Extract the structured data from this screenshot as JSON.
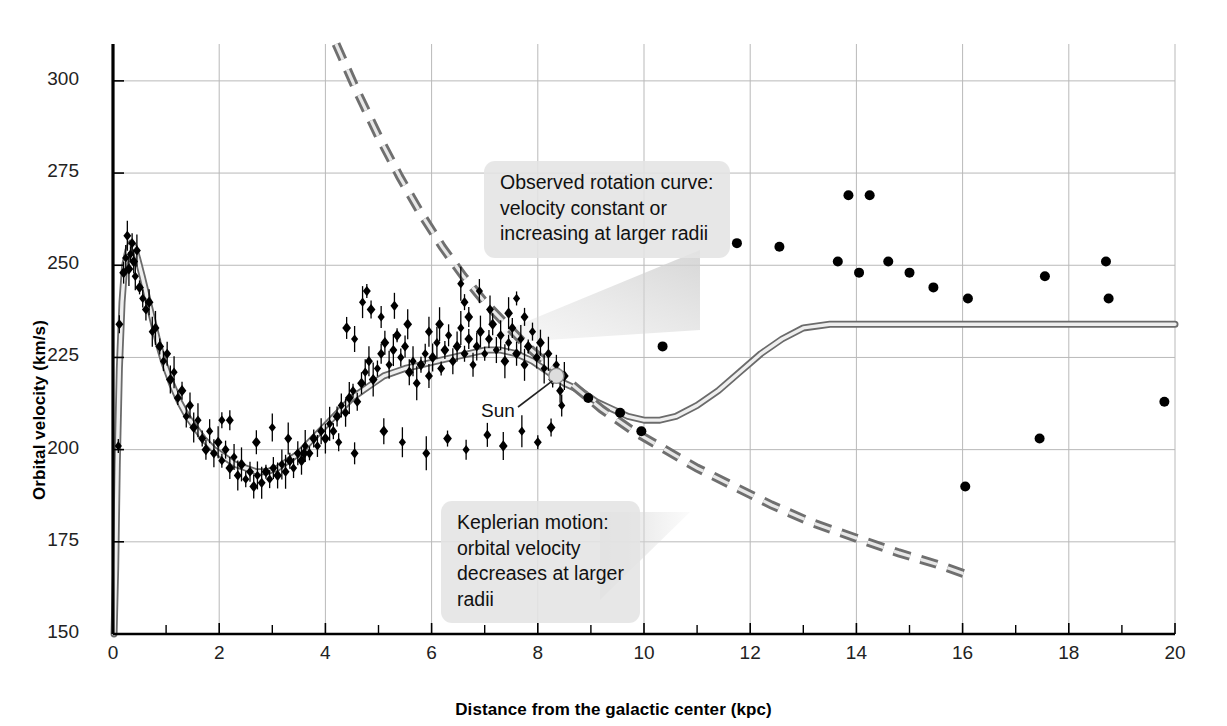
{
  "chart_data": {
    "type": "line",
    "title": "",
    "xlabel": "Distance from the galactic center (kpc)",
    "ylabel": "Orbital velocity (km/s)",
    "xlim": [
      0,
      20
    ],
    "ylim": [
      150,
      310
    ],
    "xticks": [
      0,
      2,
      4,
      6,
      8,
      10,
      12,
      14,
      16,
      18,
      20
    ],
    "xtick_labels": [
      "0",
      "2",
      "4",
      "6",
      "8",
      "10",
      "12",
      "14",
      "16",
      "18",
      "20"
    ],
    "x_minor_ticks": [
      1,
      3,
      5,
      7,
      9,
      11,
      13,
      15,
      17,
      19
    ],
    "yticks": [
      150,
      175,
      200,
      225,
      250,
      275,
      300
    ],
    "ytick_labels": [
      "150",
      "175",
      "200",
      "225",
      "250",
      "275",
      "300"
    ],
    "grid": true,
    "legend_position": "none",
    "series": [
      {
        "name": "Observed rotation curve (model fit)",
        "type": "line",
        "style": "solid-thick-gray",
        "color": "#9a9a9a",
        "points": [
          [
            0.02,
            150
          ],
          [
            0.05,
            168
          ],
          [
            0.08,
            196
          ],
          [
            0.12,
            222
          ],
          [
            0.17,
            240
          ],
          [
            0.22,
            250
          ],
          [
            0.28,
            254
          ],
          [
            0.34,
            256
          ],
          [
            0.4,
            255
          ],
          [
            0.46,
            252
          ],
          [
            0.55,
            247
          ],
          [
            0.65,
            241
          ],
          [
            0.75,
            235
          ],
          [
            0.85,
            229
          ],
          [
            0.95,
            224
          ],
          [
            1.1,
            218
          ],
          [
            1.25,
            213
          ],
          [
            1.4,
            209
          ],
          [
            1.55,
            206
          ],
          [
            1.7,
            203
          ],
          [
            1.9,
            200
          ],
          [
            2.1,
            198
          ],
          [
            2.3,
            196
          ],
          [
            2.5,
            195
          ],
          [
            2.7,
            194
          ],
          [
            2.9,
            194
          ],
          [
            3.1,
            195
          ],
          [
            3.3,
            197
          ],
          [
            3.5,
            199
          ],
          [
            3.7,
            202
          ],
          [
            3.9,
            205
          ],
          [
            4.1,
            208
          ],
          [
            4.3,
            211
          ],
          [
            4.5,
            214
          ],
          [
            4.7,
            216
          ],
          [
            4.9,
            218
          ],
          [
            5.1,
            220
          ],
          [
            5.3,
            221
          ],
          [
            5.5,
            222
          ],
          [
            5.8,
            223
          ],
          [
            6.1,
            224
          ],
          [
            6.4,
            225
          ],
          [
            6.7,
            226
          ],
          [
            7.0,
            227
          ],
          [
            7.3,
            227
          ],
          [
            7.6,
            226
          ],
          [
            7.9,
            224
          ],
          [
            8.2,
            221
          ],
          [
            8.5,
            218
          ],
          [
            8.8,
            216
          ],
          [
            9.1,
            213
          ],
          [
            9.4,
            211
          ],
          [
            9.7,
            209
          ],
          [
            10.0,
            208
          ],
          [
            10.3,
            208
          ],
          [
            10.6,
            209
          ],
          [
            11.0,
            212
          ],
          [
            11.4,
            216
          ],
          [
            11.8,
            221
          ],
          [
            12.2,
            226
          ],
          [
            12.6,
            230
          ],
          [
            13.0,
            233
          ],
          [
            13.5,
            234
          ],
          [
            14.0,
            234
          ],
          [
            16.0,
            234
          ],
          [
            18.0,
            234
          ],
          [
            20.0,
            234
          ]
        ]
      },
      {
        "name": "Keplerian motion",
        "type": "line",
        "style": "dashed-thick-gray",
        "color": "#8d8d8d",
        "points": [
          [
            4.2,
            310
          ],
          [
            4.6,
            297
          ],
          [
            5.0,
            285
          ],
          [
            5.4,
            274
          ],
          [
            5.8,
            264
          ],
          [
            6.2,
            255
          ],
          [
            6.6,
            247
          ],
          [
            7.0,
            240
          ],
          [
            7.4,
            234
          ],
          [
            7.8,
            228
          ],
          [
            8.2,
            223
          ],
          [
            8.7,
            217
          ],
          [
            9.2,
            211
          ],
          [
            9.8,
            205
          ],
          [
            10.4,
            200
          ],
          [
            11.0,
            195
          ],
          [
            11.7,
            190
          ],
          [
            12.4,
            185
          ],
          [
            13.2,
            180
          ],
          [
            14.0,
            176
          ],
          [
            14.8,
            172
          ],
          [
            15.5,
            169
          ],
          [
            16.1,
            166
          ]
        ]
      },
      {
        "name": "Inner disk measurements (with error bars)",
        "type": "scatter",
        "marker": "diamond",
        "color": "#000000",
        "points": [
          [
            0.1,
            201
          ],
          [
            0.12,
            234
          ],
          [
            0.2,
            248
          ],
          [
            0.24,
            252
          ],
          [
            0.27,
            258
          ],
          [
            0.3,
            249
          ],
          [
            0.33,
            253
          ],
          [
            0.36,
            256
          ],
          [
            0.39,
            251
          ],
          [
            0.42,
            247
          ],
          [
            0.45,
            254
          ],
          [
            0.5,
            244
          ],
          [
            0.56,
            241
          ],
          [
            0.62,
            238
          ],
          [
            0.68,
            240
          ],
          [
            0.74,
            232
          ],
          [
            0.8,
            233
          ],
          [
            0.88,
            228
          ],
          [
            0.95,
            224
          ],
          [
            1.02,
            226
          ],
          [
            1.08,
            219
          ],
          [
            1.15,
            221
          ],
          [
            1.22,
            214
          ],
          [
            1.3,
            216
          ],
          [
            1.38,
            209
          ],
          [
            1.45,
            212
          ],
          [
            1.52,
            206
          ],
          [
            1.6,
            208
          ],
          [
            1.68,
            203
          ],
          [
            1.75,
            200
          ],
          [
            1.82,
            205
          ],
          [
            1.9,
            199
          ],
          [
            1.98,
            202
          ],
          [
            2.05,
            197
          ],
          [
            2.12,
            200
          ],
          [
            2.2,
            195
          ],
          [
            2.28,
            198
          ],
          [
            2.35,
            193
          ],
          [
            2.42,
            196
          ],
          [
            2.5,
            192
          ],
          [
            2.58,
            194
          ],
          [
            2.65,
            190
          ],
          [
            2.72,
            193
          ],
          [
            2.8,
            191
          ],
          [
            2.88,
            194
          ],
          [
            2.95,
            192
          ],
          [
            3.02,
            195
          ],
          [
            3.1,
            193
          ],
          [
            3.18,
            196
          ],
          [
            3.25,
            194
          ],
          [
            3.33,
            197
          ],
          [
            3.4,
            195
          ],
          [
            3.48,
            199
          ],
          [
            3.55,
            197
          ],
          [
            3.62,
            201
          ],
          [
            3.7,
            199
          ],
          [
            3.78,
            203
          ],
          [
            3.85,
            201
          ],
          [
            3.92,
            205
          ],
          [
            4.0,
            203
          ],
          [
            4.08,
            207
          ],
          [
            4.15,
            205
          ],
          [
            4.22,
            209
          ],
          [
            4.3,
            212
          ],
          [
            4.38,
            210
          ],
          [
            4.45,
            214
          ],
          [
            4.52,
            216
          ],
          [
            4.6,
            213
          ],
          [
            4.68,
            218
          ],
          [
            4.75,
            221
          ],
          [
            4.82,
            224
          ],
          [
            4.9,
            219
          ],
          [
            4.98,
            222
          ],
          [
            5.05,
            226
          ],
          [
            5.12,
            229
          ],
          [
            5.2,
            223
          ],
          [
            5.28,
            227
          ],
          [
            5.35,
            231
          ],
          [
            5.42,
            225
          ],
          [
            5.5,
            228
          ],
          [
            5.58,
            221
          ],
          [
            5.65,
            224
          ],
          [
            5.72,
            218
          ],
          [
            5.8,
            223
          ],
          [
            5.88,
            226
          ],
          [
            5.95,
            220
          ],
          [
            6.02,
            225
          ],
          [
            6.1,
            229
          ],
          [
            6.18,
            222
          ],
          [
            6.25,
            227
          ],
          [
            6.32,
            231
          ],
          [
            6.4,
            224
          ],
          [
            6.48,
            228
          ],
          [
            6.55,
            233
          ],
          [
            6.62,
            226
          ],
          [
            6.7,
            230
          ],
          [
            6.78,
            223
          ],
          [
            6.85,
            228
          ],
          [
            6.92,
            232
          ],
          [
            7.0,
            226
          ],
          [
            7.08,
            230
          ],
          [
            7.15,
            234
          ],
          [
            7.22,
            227
          ],
          [
            7.3,
            231
          ],
          [
            7.38,
            224
          ],
          [
            7.45,
            229
          ],
          [
            7.52,
            233
          ],
          [
            7.6,
            226
          ],
          [
            7.68,
            230
          ],
          [
            7.75,
            223
          ],
          [
            7.82,
            228
          ],
          [
            7.9,
            232
          ],
          [
            7.98,
            225
          ],
          [
            8.05,
            229
          ],
          [
            8.12,
            222
          ],
          [
            8.2,
            226
          ],
          [
            8.28,
            219
          ],
          [
            8.35,
            223
          ],
          [
            8.42,
            216
          ],
          [
            8.5,
            220
          ],
          [
            4.7,
            240
          ],
          [
            4.78,
            243
          ],
          [
            4.86,
            238
          ],
          [
            5.05,
            236
          ],
          [
            5.3,
            239
          ],
          [
            5.55,
            234
          ],
          [
            6.55,
            245
          ],
          [
            6.62,
            240
          ],
          [
            6.7,
            236
          ],
          [
            6.9,
            243
          ],
          [
            7.1,
            238
          ],
          [
            7.45,
            237
          ],
          [
            7.6,
            241
          ],
          [
            7.75,
            236
          ],
          [
            4.4,
            233
          ],
          [
            4.55,
            230
          ],
          [
            5.95,
            232
          ],
          [
            6.15,
            234
          ],
          [
            2.05,
            208
          ],
          [
            2.2,
            208
          ],
          [
            2.7,
            202
          ],
          [
            3.0,
            206
          ],
          [
            3.3,
            203
          ],
          [
            3.6,
            199
          ],
          [
            4.25,
            202
          ],
          [
            4.55,
            199
          ],
          [
            5.1,
            205
          ],
          [
            5.45,
            202
          ],
          [
            5.9,
            199
          ],
          [
            6.3,
            203
          ],
          [
            6.65,
            200
          ],
          [
            7.05,
            204
          ],
          [
            7.35,
            201
          ],
          [
            7.7,
            205
          ],
          [
            8.0,
            202
          ],
          [
            8.25,
            206
          ],
          [
            8.45,
            212
          ]
        ]
      },
      {
        "name": "Outer galaxy measurements",
        "type": "scatter",
        "marker": "circle",
        "color": "#000000",
        "points": [
          [
            8.95,
            214
          ],
          [
            9.55,
            210
          ],
          [
            9.95,
            205
          ],
          [
            10.35,
            228
          ],
          [
            11.75,
            256
          ],
          [
            12.55,
            255
          ],
          [
            13.85,
            269
          ],
          [
            14.25,
            269
          ],
          [
            13.65,
            251
          ],
          [
            14.05,
            248
          ],
          [
            14.6,
            251
          ],
          [
            15.0,
            248
          ],
          [
            15.45,
            244
          ],
          [
            16.1,
            241
          ],
          [
            16.05,
            190
          ],
          [
            17.55,
            247
          ],
          [
            17.45,
            203
          ],
          [
            18.7,
            251
          ],
          [
            18.75,
            241
          ],
          [
            19.8,
            213
          ]
        ]
      }
    ],
    "annotations": [
      {
        "id": "observed-callout",
        "lines": [
          "Observed rotation curve:",
          "velocity constant or",
          "increasing at larger radii"
        ],
        "points_to": "observed rotation curve"
      },
      {
        "id": "keplerian-callout",
        "lines": [
          "Keplerian motion:",
          "orbital velocity",
          "decreases at larger",
          "radii"
        ],
        "points_to": "keplerian dashed curve"
      },
      {
        "id": "sun-label",
        "text": "Sun",
        "marker_x": 8.35,
        "marker_y": 220
      }
    ],
    "colors": {
      "observed_curve": "#9a9a9a",
      "keplerian_curve": "#8d8d8d",
      "data_points": "#000000",
      "grid": "#b9b9b9",
      "axis": "#000000",
      "callout_background": "#e4e4e4"
    }
  }
}
